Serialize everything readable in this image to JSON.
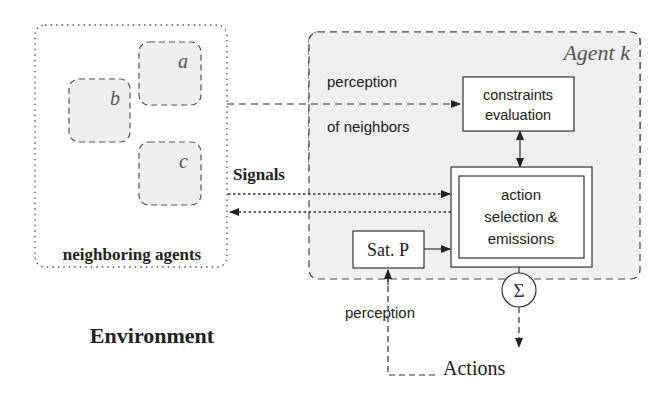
{
  "diagram": {
    "environment_label": "Environment",
    "neighbors_group": {
      "label": "neighboring agents",
      "agents": [
        {
          "id": "a",
          "label": "a"
        },
        {
          "id": "b",
          "label": "b"
        },
        {
          "id": "c",
          "label": "c"
        }
      ]
    },
    "agent": {
      "title": "Agent k",
      "nodes": {
        "constraints": {
          "line1": "constraints",
          "line2": "evaluation"
        },
        "action": {
          "line1": "action",
          "line2": "selection &",
          "line3": "emissions"
        },
        "satp": {
          "label": "Sat. P"
        },
        "sum": {
          "symbol": "Σ"
        }
      },
      "labels": {
        "perception_neighbors_1": "perception",
        "perception_neighbors_2": "of neighbors",
        "perception_bottom": "perception"
      }
    },
    "edge_labels": {
      "signals": "Signals",
      "actions": "Actions"
    },
    "colors": {
      "agent_fill": "#efefef",
      "neighbor_fill": "#eeeeee",
      "stroke": "#333333",
      "text": "#222222"
    }
  }
}
